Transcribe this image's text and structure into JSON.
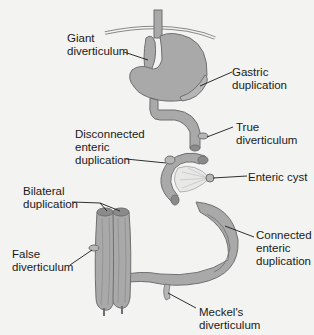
{
  "diagram": {
    "colors": {
      "background": "#f3f3f1",
      "organ_fill": "#a9a9a9",
      "organ_stroke": "#6f6f6f",
      "leader_line": "#1a1a1a",
      "text": "#1a1a1a"
    },
    "labels": [
      {
        "id": "giant-diverticulum",
        "text": "Giant\ndiverticulum"
      },
      {
        "id": "gastric-duplication",
        "text": "Gastric\nduplication"
      },
      {
        "id": "true-diverticulum",
        "text": "True\ndiverticulum"
      },
      {
        "id": "disconnected-enteric-duplication",
        "text": "Disconnected\nenteric\nduplication"
      },
      {
        "id": "enteric-cyst",
        "text": "Enteric cyst"
      },
      {
        "id": "bilateral-duplication",
        "text": "Bilateral\nduplication"
      },
      {
        "id": "false-diverticulum",
        "text": "False\ndiverticulum"
      },
      {
        "id": "connected-enteric-duplication",
        "text": "Connected\nenteric\nduplication"
      },
      {
        "id": "meckels-diverticulum",
        "text": "Meckel's\ndiverticulum"
      }
    ]
  }
}
